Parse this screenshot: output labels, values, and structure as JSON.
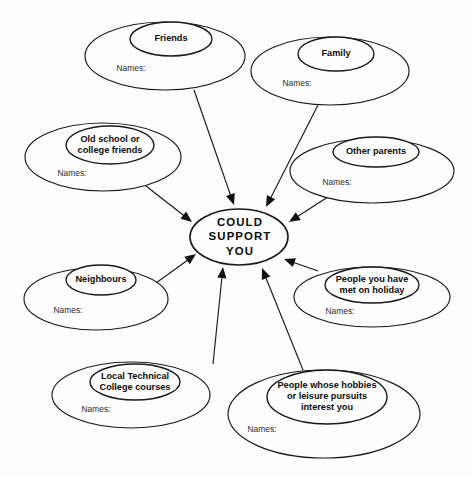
{
  "diagram": {
    "type": "hub-and-spoke-venn",
    "center": {
      "label_lines": [
        "COULD",
        "SUPPORT",
        "YOU"
      ],
      "line1": "COULD",
      "line2": "SUPPORT",
      "line3": "YOU",
      "cx": 239,
      "cy": 237,
      "rx": 49,
      "ry": 28
    },
    "names_label": "Names:",
    "colors": {
      "background": "#fdfdfd",
      "stroke": "#1a1a1a",
      "text": "#0d0d0d",
      "names_text": "#2b2b2b"
    },
    "nodes": [
      {
        "id": "friends",
        "label_lines": [
          "Friends"
        ],
        "line1": "Friends",
        "line2": "",
        "line3": "",
        "names": "Names:",
        "outer": {
          "cx": 165,
          "cy": 56,
          "rx": 80,
          "ry": 34
        },
        "inner": {
          "cx": 171,
          "cy": 39,
          "rx": 41,
          "ry": 17
        },
        "names_pos": {
          "x": 131,
          "y": 69
        },
        "arrow": {
          "x1": 194,
          "y1": 90,
          "x2": 234,
          "y2": 205
        }
      },
      {
        "id": "family",
        "label_lines": [
          "Family"
        ],
        "line1": "Family",
        "line2": "",
        "line3": "",
        "names": "Names:",
        "outer": {
          "cx": 330,
          "cy": 71,
          "rx": 79,
          "ry": 34
        },
        "inner": {
          "cx": 336,
          "cy": 54,
          "rx": 38,
          "ry": 17
        },
        "names_pos": {
          "x": 297,
          "y": 84
        },
        "arrow": {
          "x1": 318,
          "y1": 105,
          "x2": 266,
          "y2": 207
        }
      },
      {
        "id": "old-school",
        "label_lines": [
          "Old school or",
          "college friends"
        ],
        "line1": "Old school or",
        "line2": "college friends",
        "line3": "",
        "names": "Names:",
        "outer": {
          "cx": 103,
          "cy": 157,
          "rx": 78,
          "ry": 34
        },
        "inner": {
          "cx": 110,
          "cy": 145,
          "rx": 44,
          "ry": 19
        },
        "names_pos": {
          "x": 72,
          "y": 174
        },
        "arrow": {
          "x1": 146,
          "y1": 186,
          "x2": 192,
          "y2": 222
        }
      },
      {
        "id": "other-parents",
        "label_lines": [
          "Other parents"
        ],
        "line1": "Other parents",
        "line2": "",
        "line3": "",
        "names": "Names:",
        "outer": {
          "cx": 372,
          "cy": 171,
          "rx": 82,
          "ry": 32
        },
        "inner": {
          "cx": 376,
          "cy": 152,
          "rx": 43,
          "ry": 15
        },
        "names_pos": {
          "x": 337,
          "y": 183
        },
        "arrow": {
          "x1": 334,
          "y1": 193,
          "x2": 289,
          "y2": 222
        }
      },
      {
        "id": "neighbours",
        "label_lines": [
          "Neighbours"
        ],
        "line1": "Neighbours",
        "line2": "",
        "line3": "",
        "names": "Names:",
        "outer": {
          "cx": 96,
          "cy": 299,
          "rx": 72,
          "ry": 31
        },
        "inner": {
          "cx": 101,
          "cy": 280,
          "rx": 35,
          "ry": 15
        },
        "names_pos": {
          "x": 68,
          "y": 311
        },
        "arrow": {
          "x1": 156,
          "y1": 283,
          "x2": 196,
          "y2": 254
        }
      },
      {
        "id": "holiday",
        "label_lines": [
          "People you have",
          "met on holiday"
        ],
        "line1": "People you have",
        "line2": "met on holiday",
        "line3": "",
        "names": "Names:",
        "outer": {
          "cx": 372,
          "cy": 297,
          "rx": 78,
          "ry": 30
        },
        "inner": {
          "cx": 372,
          "cy": 285,
          "rx": 47,
          "ry": 18
        },
        "names_pos": {
          "x": 340,
          "y": 312
        },
        "arrow": {
          "x1": 318,
          "y1": 271,
          "x2": 284,
          "y2": 259
        }
      },
      {
        "id": "college-courses",
        "label_lines": [
          "Local Technical",
          "College courses"
        ],
        "line1": "Local Technical",
        "line2": "College courses",
        "line3": "",
        "names": "Names:",
        "outer": {
          "cx": 131,
          "cy": 395,
          "rx": 79,
          "ry": 33
        },
        "inner": {
          "cx": 135,
          "cy": 382,
          "rx": 45,
          "ry": 18
        },
        "names_pos": {
          "x": 96,
          "y": 410
        },
        "arrow": {
          "x1": 213,
          "y1": 364,
          "x2": 223,
          "y2": 267
        }
      },
      {
        "id": "hobbies",
        "label_lines": [
          "People whose hobbies",
          "or leisure pursuits",
          "interest you"
        ],
        "line1": "People whose hobbies",
        "line2": "or leisure pursuits",
        "line3": "interest you",
        "names": "Names:",
        "outer": {
          "cx": 324,
          "cy": 414,
          "rx": 96,
          "ry": 44
        },
        "inner": {
          "cx": 327,
          "cy": 397,
          "rx": 60,
          "ry": 27
        },
        "names_pos": {
          "x": 262,
          "y": 430
        },
        "arrow": {
          "x1": 303,
          "y1": 370,
          "x2": 262,
          "y2": 268
        }
      }
    ]
  }
}
